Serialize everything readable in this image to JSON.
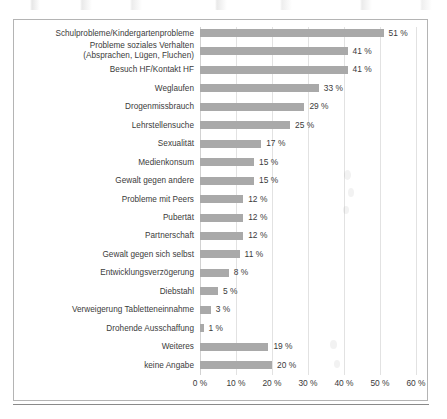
{
  "chart_data": {
    "type": "bar",
    "orientation": "horizontal",
    "title": "",
    "xlabel": "",
    "ylabel": "",
    "xlim": [
      0,
      60
    ],
    "xticks": [
      0,
      10,
      20,
      30,
      40,
      50,
      60
    ],
    "xtick_labels": [
      "0 %",
      "10 %",
      "20 %",
      "30 %",
      "40 %",
      "50 %",
      "60 %"
    ],
    "grid": true,
    "legend": "none",
    "value_suffix": " %",
    "bar_color": "#a9a9a9",
    "categories": [
      "Schulprobleme/Kindergartenprobleme",
      "Probleme soziales Verhalten\n(Absprachen, Lügen, Fluchen)",
      "Besuch HF/Kontakt HF",
      "Weglaufen",
      "Drogenmissbrauch",
      "Lehrstellensuche",
      "Sexualität",
      "Medienkonsum",
      "Gewalt gegen andere",
      "Probleme mit Peers",
      "Pubertät",
      "Partnerschaft",
      "Gewalt gegen sich selbst",
      "Entwicklungsverzögerung",
      "Diebstahl",
      "Verweigerung Tabletteneinnahme",
      "Drohende Ausschaffung",
      "Weiteres",
      "keine Angabe"
    ],
    "values": [
      51,
      41,
      41,
      33,
      29,
      25,
      17,
      15,
      15,
      12,
      12,
      12,
      11,
      8,
      5,
      3,
      1,
      19,
      20
    ],
    "value_labels": [
      "51 %",
      "41 %",
      "41 %",
      "33 %",
      "29 %",
      "25 %",
      "17 %",
      "15 %",
      "15 %",
      "12 %",
      "12 %",
      "12 %",
      "11 %",
      "8 %",
      "5 %",
      "3 %",
      "1 %",
      "19 %",
      "20 %"
    ]
  },
  "frame": {
    "border_color": "#b4b4b4",
    "background": "#ffffff"
  }
}
